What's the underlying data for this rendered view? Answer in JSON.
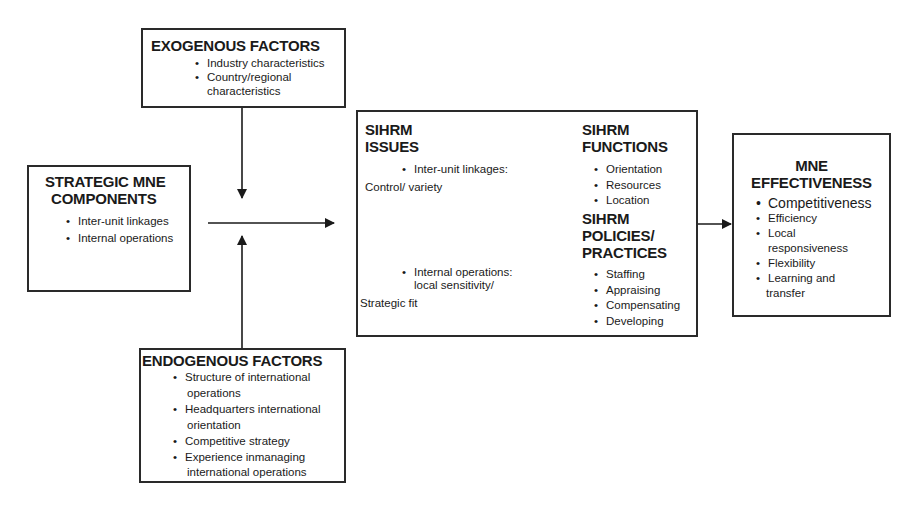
{
  "diagram": {
    "exogenous": {
      "title": "EXOGENOUS FACTORS",
      "items": [
        "Industry characteristics",
        "Country/regional",
        "characteristics"
      ]
    },
    "strategic": {
      "title_line1": "STRATEGIC MNE",
      "title_line2": "COMPONENTS",
      "items": [
        "Inter-unit linkages",
        "Internal operations"
      ]
    },
    "endogenous": {
      "title": "ENDOGENOUS FACTORS",
      "items": [
        "Structure of international",
        "operations",
        "Headquarters international",
        "orientation",
        "Competitive strategy",
        "Experience inmanaging",
        "international operations"
      ]
    },
    "sihrm_issues": {
      "title_line1": "SIHRM",
      "title_line2": "ISSUES",
      "bullet1": "Inter-unit linkages:",
      "text1": "Control/ variety",
      "bullet2_line1": "Internal operations:",
      "bullet2_line2": "local sensitivity/",
      "text2": "Strategic fit"
    },
    "sihrm_functions": {
      "title_line1": "SIHRM",
      "title_line2": "FUNCTIONS",
      "items": [
        "Orientation",
        "Resources",
        "Location"
      ]
    },
    "sihrm_policies": {
      "title_line1": "SIHRM",
      "title_line2": "POLICIES/",
      "title_line3": "PRACTICES",
      "items": [
        "Staffing",
        "Appraising",
        "Compensating",
        "Developing"
      ]
    },
    "mne_effectiveness": {
      "title_line1": "MNE",
      "title_line2": "EFFECTIVENESS",
      "items": [
        "Competitiveness",
        "Efficiency",
        "Local",
        "responsiveness",
        "Flexibility",
        "Learning and",
        "transfer"
      ]
    }
  }
}
